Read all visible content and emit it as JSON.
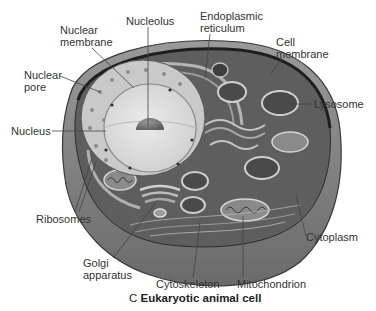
{
  "figure": {
    "title_prefix": "C",
    "title": "Eukaryotic animal cell",
    "colors": {
      "background": "#ffffff",
      "cell_wall_outer": "#6e6e6e",
      "cell_wall_side": "#8a8a8a",
      "cytoplasm": "#5a5a5a",
      "nucleus": "#d9d9d9",
      "nucleus_inner": "#e8e8e8",
      "nucleolus": "#777777",
      "label_text": "#333333",
      "leader_line": "#444444"
    }
  },
  "labels": {
    "nucleolus": "Nucleolus",
    "nuclear_membrane_1": "Nuclear",
    "nuclear_membrane_2": "membrane",
    "er_1": "Endoplasmic",
    "er_2": "reticulum",
    "cell_membrane_1": "Cell",
    "cell_membrane_2": "membrane",
    "nuclear_pore_1": "Nuclear",
    "nuclear_pore_2": "pore",
    "lysosome": "Lysosome",
    "nucleus": "Nucleus",
    "ribosomes": "Ribosomes",
    "golgi_1": "Golgi",
    "golgi_2": "apparatus",
    "cytoplasm": "Cytoplasm",
    "cytoskeleton": "Cytoskeleton",
    "mitochondrion": "Mitochondrion"
  }
}
